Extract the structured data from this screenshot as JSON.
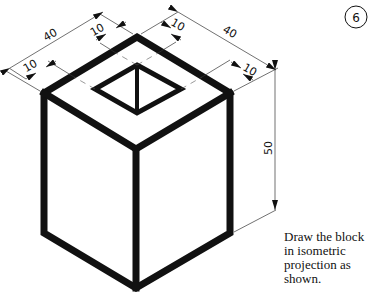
{
  "figure": {
    "number": "6",
    "dimensions": {
      "top_left_length": "40",
      "top_left_wall": "10",
      "top_left_inner_offset": "10",
      "top_right_inner_offset": "10",
      "top_right_length": "40",
      "right_wall": "10",
      "height": "50"
    },
    "instruction_lines": [
      "Draw the block",
      "in isometric",
      "projection as",
      "shown."
    ]
  },
  "colors": {
    "ink": "#111111",
    "paper": "#ffffff"
  }
}
